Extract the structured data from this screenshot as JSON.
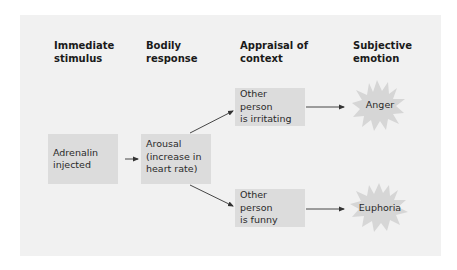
{
  "diagram": {
    "type": "flowchart",
    "title": "",
    "colors": {
      "panel_background": "#f1f1f1",
      "box_fill": "#dcdcdc",
      "burst_fill": "#d6d6d6",
      "arrow": "#333333",
      "text": "#1e1e1e"
    },
    "columns": [
      {
        "line1": "Immediate",
        "line2": "stimulus"
      },
      {
        "line1": "Bodily",
        "line2": "response"
      },
      {
        "line1": "Appraisal of",
        "line2": "context"
      },
      {
        "line1": "Subjective",
        "line2": "emotion"
      }
    ],
    "nodes": {
      "stimulus": {
        "line1": "Adrenalin",
        "line2": "injected"
      },
      "response": {
        "line1": "Arousal",
        "line2": "(increase in",
        "line3": "heart rate)"
      },
      "appraisal_top": {
        "line1": "Other person",
        "line2": "is irritating"
      },
      "appraisal_bottom": {
        "line1": "Other person",
        "line2": "is funny"
      },
      "emotion_top": {
        "label": "Anger"
      },
      "emotion_bottom": {
        "label": "Euphoria"
      }
    },
    "edges": [
      {
        "from": "stimulus",
        "to": "response"
      },
      {
        "from": "response",
        "to": "appraisal_top"
      },
      {
        "from": "response",
        "to": "appraisal_bottom"
      },
      {
        "from": "appraisal_top",
        "to": "emotion_top"
      },
      {
        "from": "appraisal_bottom",
        "to": "emotion_bottom"
      }
    ]
  }
}
